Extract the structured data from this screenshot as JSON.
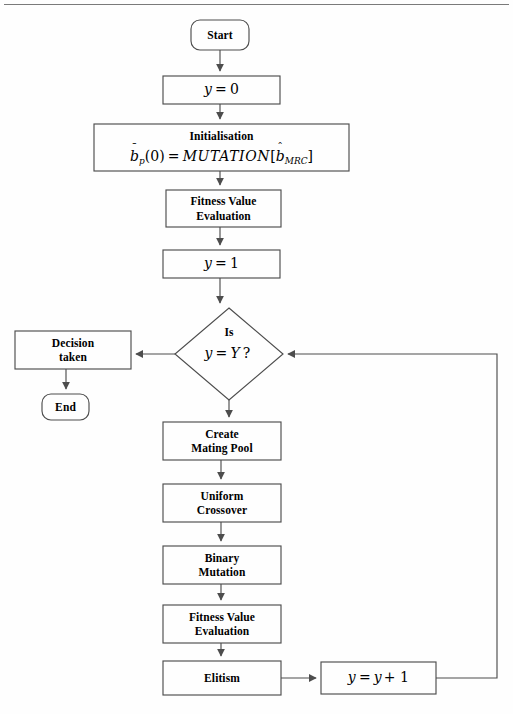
{
  "diagram": {
    "type": "flowchart",
    "stroke_color": "#4d4d4d",
    "text_color": "#000000",
    "background": "#fefefe",
    "nodes": [
      {
        "id": "start",
        "shape": "rounded",
        "label": "Start"
      },
      {
        "id": "y0",
        "shape": "rect",
        "label": "y = 0"
      },
      {
        "id": "init",
        "shape": "rect",
        "label": "Initialisation",
        "formula": "b̄p(0) = MUTATION[b̂MRC]"
      },
      {
        "id": "fitness1",
        "shape": "rect",
        "label_line1": "Fitness Value",
        "label_line2": "Evaluation"
      },
      {
        "id": "y1",
        "shape": "rect",
        "label": "y = 1"
      },
      {
        "id": "decision",
        "shape": "diamond",
        "label_line1": "Is",
        "label_line2": "y = Y ?"
      },
      {
        "id": "decision_taken",
        "shape": "rect",
        "label_line1": "Decision",
        "label_line2": "taken"
      },
      {
        "id": "end",
        "shape": "rounded",
        "label": "End"
      },
      {
        "id": "mating",
        "shape": "rect",
        "label_line1": "Create",
        "label_line2": "Mating Pool"
      },
      {
        "id": "crossover",
        "shape": "rect",
        "label_line1": "Uniform",
        "label_line2": "Crossover"
      },
      {
        "id": "mutation",
        "shape": "rect",
        "label_line1": "Binary",
        "label_line2": "Mutation"
      },
      {
        "id": "fitness2",
        "shape": "rect",
        "label_line1": "Fitness Value",
        "label_line2": "Evaluation"
      },
      {
        "id": "elitism",
        "shape": "rect",
        "label": "Elitism"
      },
      {
        "id": "increment",
        "shape": "rect",
        "label": "y = y + 1"
      }
    ],
    "edges": [
      {
        "from": "start",
        "to": "y0"
      },
      {
        "from": "y0",
        "to": "init"
      },
      {
        "from": "init",
        "to": "fitness1"
      },
      {
        "from": "fitness1",
        "to": "y1"
      },
      {
        "from": "y1",
        "to": "decision"
      },
      {
        "from": "decision",
        "to": "decision_taken",
        "direction": "left"
      },
      {
        "from": "decision_taken",
        "to": "end"
      },
      {
        "from": "decision",
        "to": "mating",
        "direction": "down"
      },
      {
        "from": "mating",
        "to": "crossover"
      },
      {
        "from": "crossover",
        "to": "mutation"
      },
      {
        "from": "mutation",
        "to": "fitness2"
      },
      {
        "from": "fitness2",
        "to": "elitism"
      },
      {
        "from": "elitism",
        "to": "increment",
        "direction": "right"
      },
      {
        "from": "increment",
        "to": "decision",
        "direction": "feedback-right"
      }
    ]
  },
  "labels": {
    "start": "Start",
    "end": "End",
    "y_zero": "y = 0",
    "y_one": "y = 1",
    "initialisation": "Initialisation",
    "fitness_value": "Fitness Value",
    "evaluation": "Evaluation",
    "is": "Is",
    "decision": "Decision",
    "taken": "taken",
    "create": "Create",
    "mating_pool": "Mating Pool",
    "uniform": "Uniform",
    "crossover": "Crossover",
    "binary": "Binary",
    "mutation": "Mutation",
    "elitism": "Elitism",
    "y_var": "y",
    "Y_var": "Y",
    "b_var": "b",
    "p_sub": "p",
    "mrc_sub": "MRC",
    "mutation_func": "MUTATION",
    "eq": "=",
    "zero": "0",
    "one": "1",
    "question": "?",
    "plus_one": "+ 1",
    "paren_zero": "(0)",
    "bracket_open": "[",
    "bracket_close": "]",
    "bar_accent": "ˉ",
    "hat_accent": "ˆ"
  }
}
